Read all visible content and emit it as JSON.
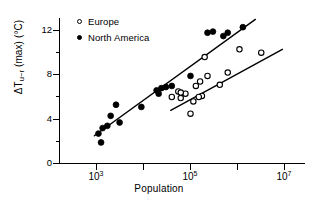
{
  "figure": {
    "background": "#ffffff",
    "ink": "#000000"
  },
  "chart_data": {
    "type": "scatter",
    "title": "",
    "subtitle": "",
    "xlabel": "Population",
    "ylabel": "ΔTᵤ₋ᵣ (max) (°C)",
    "ylabel_parts": {
      "delta_t": "ΔT",
      "subscript": "u−r",
      "qualifier": "(max)",
      "units": "(°C)"
    },
    "xscale": "log",
    "yscale": "linear",
    "xlim": [
      300,
      20000000
    ],
    "ylim": [
      -0.6,
      13.6
    ],
    "grid": false,
    "legend_position": "top-left",
    "xticks": [
      1000,
      10000,
      100000,
      1000000,
      10000000
    ],
    "xticklabels": [
      "10³",
      "",
      "10⁵",
      "",
      "10⁷"
    ],
    "xtick_label_data": [
      {
        "value": 1000,
        "base": "10",
        "exp": "3",
        "labeled": true
      },
      {
        "value": 10000,
        "base": "10",
        "exp": "4",
        "labeled": false
      },
      {
        "value": 100000,
        "base": "10",
        "exp": "5",
        "labeled": true
      },
      {
        "value": 1000000,
        "base": "10",
        "exp": "6",
        "labeled": false
      },
      {
        "value": 10000000,
        "base": "10",
        "exp": "7",
        "labeled": true
      }
    ],
    "yticks": [
      0,
      2,
      4,
      6,
      8,
      10,
      12
    ],
    "yticklabels": [
      "0",
      "",
      "4",
      "",
      "8",
      "",
      "12"
    ],
    "ytick_label_data": [
      {
        "value": 12,
        "label": "12",
        "labeled": true
      },
      {
        "value": 10,
        "label": "",
        "labeled": false
      },
      {
        "value": 8,
        "label": "8",
        "labeled": true
      },
      {
        "value": 6,
        "label": "",
        "labeled": false
      },
      {
        "value": 4,
        "label": "4",
        "labeled": true
      },
      {
        "value": 2,
        "label": "",
        "labeled": false
      },
      {
        "value": 0,
        "label": "0",
        "labeled": true
      }
    ],
    "series": [
      {
        "name": "Europe",
        "marker": "open-circle",
        "color": "#000000",
        "fill": "#ffffff",
        "points": [
          [
            40000,
            6.0
          ],
          [
            55000,
            6.5
          ],
          [
            62000,
            5.9
          ],
          [
            78000,
            6.3
          ],
          [
            100000,
            4.5
          ],
          [
            115000,
            5.6
          ],
          [
            130000,
            7.0
          ],
          [
            160000,
            7.4
          ],
          [
            175000,
            6.1
          ],
          [
            200000,
            9.6
          ],
          [
            230000,
            7.9
          ],
          [
            420000,
            7.1
          ],
          [
            620000,
            8.2
          ],
          [
            1100000,
            10.3
          ],
          [
            3200000,
            10.0
          ],
          [
            62000,
            6.4
          ],
          [
            150000,
            6.0
          ]
        ],
        "trendline": {
          "x1": 38000,
          "y1": 4.8,
          "x2": 9000000,
          "y2": 10.3
        }
      },
      {
        "name": "North America",
        "marker": "filled-circle",
        "color": "#000000",
        "fill": "#000000",
        "points": [
          [
            1100,
            2.7
          ],
          [
            1250,
            1.9
          ],
          [
            1350,
            3.2
          ],
          [
            1700,
            3.4
          ],
          [
            2000,
            4.3
          ],
          [
            2600,
            5.3
          ],
          [
            3100,
            3.7
          ],
          [
            9000,
            5.1
          ],
          [
            19000,
            6.6
          ],
          [
            21000,
            6.3
          ],
          [
            24000,
            6.8
          ],
          [
            30000,
            6.9
          ],
          [
            40000,
            7.0
          ],
          [
            100000,
            7.9
          ],
          [
            230000,
            11.8
          ],
          [
            300000,
            11.9
          ],
          [
            500000,
            11.5
          ],
          [
            620000,
            11.8
          ],
          [
            1300000,
            12.3
          ]
        ],
        "trendline": {
          "x1": 900,
          "y1": 2.5,
          "x2": 2400000,
          "y2": 13.0
        }
      }
    ],
    "annotations": []
  },
  "legend": {
    "items": [
      {
        "label": "Europe",
        "marker": "open-circle"
      },
      {
        "label": "North America",
        "marker": "filled-circle"
      }
    ]
  },
  "axes": {
    "x_title": "Population",
    "y_title_text": "ΔT"
  }
}
